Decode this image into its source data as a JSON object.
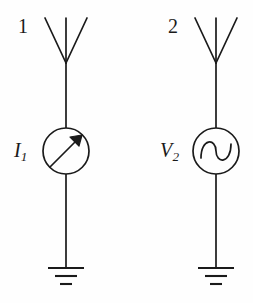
{
  "figure": {
    "background_color": "#fefefe",
    "stroke_color": "#1a1a1a",
    "width": 253,
    "height": 303
  },
  "branches": [
    {
      "id": "branch-1",
      "port_label": "1",
      "source_label_main": "I",
      "source_label_sub": "1",
      "source_type": "current-source",
      "source_symbol": "diagonal-arrow",
      "antenna": "v-dipole-antenna",
      "ground": "earth-ground",
      "center_x": 66
    },
    {
      "id": "branch-2",
      "port_label": "2",
      "source_label_main": "V",
      "source_label_sub": "2",
      "source_type": "voltage-source-ac",
      "source_symbol": "sine-wave",
      "antenna": "v-dipole-antenna",
      "ground": "earth-ground",
      "center_x": 216
    }
  ],
  "geometry": {
    "antenna_apex_y": 63,
    "antenna_top_y": 18,
    "antenna_half_span": 21,
    "circle_center_y": 151,
    "circle_radius": 23,
    "ground_stem_bottom_y": 268,
    "ground_bar_widths": [
      36,
      22,
      12
    ],
    "ground_bar_ys": [
      268,
      276,
      284
    ]
  }
}
